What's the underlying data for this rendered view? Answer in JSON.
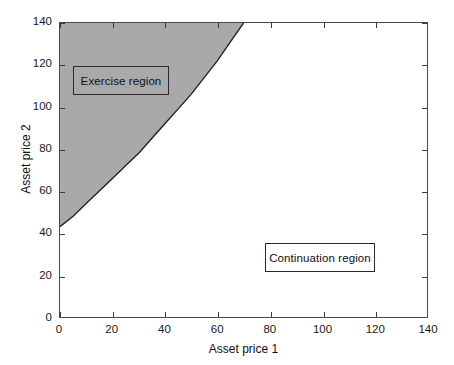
{
  "chart_data": {
    "type": "area",
    "title": "",
    "subtitle": "",
    "xlabel": "Asset price 1",
    "ylabel": "Asset price 2",
    "xlim": [
      0,
      140
    ],
    "ylim": [
      0,
      140
    ],
    "xticks": [
      0,
      20,
      40,
      60,
      80,
      100,
      120,
      140
    ],
    "yticks": [
      0,
      20,
      40,
      60,
      80,
      100,
      120,
      140
    ],
    "xticklabels": [
      "0",
      "20",
      "40",
      "60",
      "80",
      "100",
      "120",
      "140"
    ],
    "yticklabels": [
      "0",
      "20",
      "40",
      "60",
      "80",
      "100",
      "120",
      "140"
    ],
    "grid": false,
    "legend": null,
    "series": [
      {
        "name": "Exercise boundary",
        "type": "line",
        "description": "Free boundary separating the exercise region (upper-left, shaded) from the continuation region (lower-right, white). Slightly convex curve.",
        "x": [
          0,
          5,
          10,
          15,
          20,
          25,
          30,
          35,
          40,
          45,
          50,
          55,
          60,
          65,
          70
        ],
        "y": [
          43,
          48,
          54,
          60,
          66,
          72,
          78,
          85,
          92,
          99,
          106,
          114,
          122,
          131,
          140
        ]
      }
    ],
    "shaded_regions": [
      {
        "name": "Exercise region",
        "fill_color": "#a9a9a9",
        "vertices_description": "Bounded by left axis from (0,43) to (0,140), top axis from (0,140) to (70,140), and the exercise boundary curve back down to (0,43)."
      }
    ],
    "annotations": [
      {
        "name": "exercise-region-label",
        "text": "Exercise region",
        "x_data": 5,
        "y_data": 122,
        "boxed": true
      },
      {
        "name": "continuation-region-label",
        "text": "Continuation region",
        "x_data": 82,
        "y_data": 56,
        "boxed": true
      }
    ],
    "colors": {
      "exercise_fill": "#a9a9a9",
      "boundary_line": "#222222",
      "axis": "#4a4a4a",
      "background": "#ffffff",
      "text": "#111111"
    }
  }
}
